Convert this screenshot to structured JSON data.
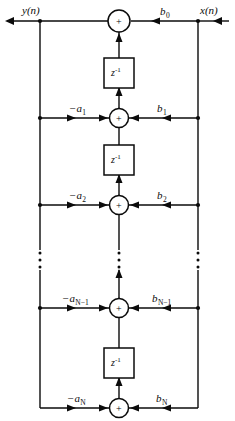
{
  "figure": {
    "kind": "signal-flow-graph",
    "name": "direct-form-ii-iir-filter",
    "width": 235,
    "height": 421,
    "background_color": "#ffffff",
    "line_color": "#0b0b0b"
  },
  "signals": {
    "output_label": "y(n)",
    "input_label": "x(n)"
  },
  "adders": [
    {
      "id": "adder-0",
      "symbol": "+",
      "cx": 119,
      "cy": 21,
      "r": 11
    },
    {
      "id": "adder-1",
      "symbol": "+",
      "cx": 119,
      "cy": 118,
      "r": 9.5
    },
    {
      "id": "adder-2",
      "symbol": "+",
      "cx": 119,
      "cy": 205,
      "r": 9.5
    },
    {
      "id": "adder-3",
      "symbol": "+",
      "cx": 119,
      "cy": 308,
      "r": 9.5
    },
    {
      "id": "adder-4",
      "symbol": "+",
      "cx": 119,
      "cy": 408,
      "r": 9.5
    }
  ],
  "delays": [
    {
      "id": "delay-1",
      "label_base": "z",
      "label_exp": "-1",
      "x": 104,
      "y": 58,
      "w": 30,
      "h": 30
    },
    {
      "id": "delay-2",
      "label_base": "z",
      "label_exp": "-1",
      "x": 104,
      "y": 145,
      "w": 30,
      "h": 30
    },
    {
      "id": "delay-3",
      "label_base": "z",
      "label_exp": "-1",
      "x": 104,
      "y": 348,
      "w": 30,
      "h": 30
    }
  ],
  "taps": [
    {
      "id": "tap-0",
      "row_y": 21,
      "feedback_label": null,
      "feedforward_base": "b",
      "feedforward_sub": "0",
      "feedforward_label_x": 160,
      "feedforward_label_y": 6
    },
    {
      "id": "tap-1",
      "row_y": 118,
      "feedback_base": "−a",
      "feedback_sub": "1",
      "feedback_label_x": 69,
      "feedback_label_y": 103,
      "feedforward_base": "b",
      "feedforward_sub": "1",
      "feedforward_label_x": 157,
      "feedforward_label_y": 103
    },
    {
      "id": "tap-2",
      "row_y": 205,
      "feedback_base": "−a",
      "feedback_sub": "2",
      "feedback_label_x": 69,
      "feedback_label_y": 190,
      "feedforward_base": "b",
      "feedforward_sub": "2",
      "feedforward_label_x": 157,
      "feedforward_label_y": 190
    },
    {
      "id": "tap-n-minus-1",
      "row_y": 308,
      "feedback_base": "−a",
      "feedback_sub": "N−1",
      "feedback_label_x": 62,
      "feedback_label_y": 293,
      "feedforward_base": "b",
      "feedforward_sub": "N−1",
      "feedforward_label_x": 152,
      "feedforward_label_y": 293
    },
    {
      "id": "tap-n",
      "row_y": 408,
      "feedback_base": "−a",
      "feedback_sub": "N",
      "feedback_label_x": 67,
      "feedback_label_y": 393,
      "feedforward_base": "b",
      "feedforward_sub": "N",
      "feedforward_label_x": 156,
      "feedforward_label_y": 393
    }
  ],
  "ellipsis": {
    "symbol": "vertical-dots",
    "dot_count": 3,
    "y_start": 252,
    "y_spacing": 7,
    "columns": [
      40,
      119,
      198
    ]
  },
  "geometry": {
    "left_rail_x": 40,
    "center_rail_x": 119,
    "right_rail_x": 198,
    "top_rail_y": 21,
    "bottom_rail_y": 408,
    "output_arrow_x": 6,
    "input_arrow_x": 229
  }
}
